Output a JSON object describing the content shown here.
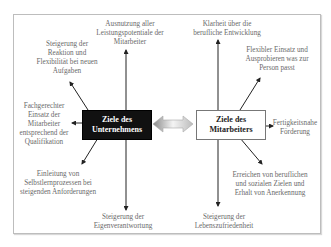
{
  "diagram": {
    "left_center": {
      "line1": "Ziele des",
      "line2": "Unternehmens"
    },
    "right_center": {
      "line1": "Ziele des",
      "line2": "Mitarbeiters"
    },
    "left_goals": [
      {
        "id": "top",
        "lines": [
          "Ausnutzung aller",
          "Leistungspotentiale der",
          "Mitarbeiter"
        ]
      },
      {
        "id": "upper-left",
        "lines": [
          "Steigerung der",
          "Reaktion und",
          "Flexibilität bei neuen",
          "Aufgaben"
        ]
      },
      {
        "id": "left",
        "lines": [
          "Fachgerechter",
          "Einsatz der",
          "Mitarbeiter",
          "entsprechend der",
          "Qualifikation"
        ]
      },
      {
        "id": "lower-left",
        "lines": [
          "Einleitung von",
          "Selbstlernprozessen bei",
          "steigenden Anforderungen"
        ]
      },
      {
        "id": "bottom",
        "lines": [
          "Steigerung der",
          "Eigenverantwortung"
        ]
      }
    ],
    "right_goals": [
      {
        "id": "top",
        "lines": [
          "Klarheit über die",
          "berufliche Entwicklung"
        ]
      },
      {
        "id": "upper-right",
        "lines": [
          "Flexibler Einsatz und",
          "Ausprobieren was zur",
          "Person passt"
        ]
      },
      {
        "id": "right",
        "lines": [
          "Fertigkeitsnahe",
          "Förderung"
        ]
      },
      {
        "id": "lower-right",
        "lines": [
          "Erreichen von beruflichen",
          "und sozialen Zielen und",
          "Erhalt von Anerkennung"
        ]
      },
      {
        "id": "bottom",
        "lines": [
          "Steigerung der",
          "Lebenszufriedenheit"
        ]
      }
    ],
    "connector": "double-arrow"
  }
}
